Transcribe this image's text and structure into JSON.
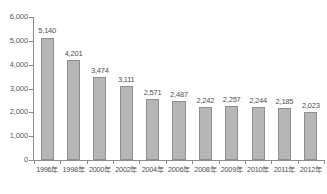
{
  "chart_data": {
    "type": "bar",
    "title": "",
    "subtitle": "",
    "xlabel": "",
    "ylabel": "",
    "ylim": [
      0,
      6000
    ],
    "ytick_values": [
      0,
      1000,
      2000,
      3000,
      4000,
      5000,
      6000
    ],
    "ytick_labels": [
      "0",
      "1,000",
      "2,000",
      "3,000",
      "4,000",
      "5,000",
      "6,000"
    ],
    "grid": false,
    "legend": null,
    "categories": [
      "1996年",
      "1998年",
      "2000年",
      "2002年",
      "2004年",
      "2006年",
      "2008年",
      "2009年",
      "2010年",
      "2011年",
      "2012年"
    ],
    "values": [
      5140,
      4201,
      3474,
      3111,
      2571,
      2487,
      2242,
      2257,
      2244,
      2185,
      2023
    ],
    "value_labels": [
      "5,140",
      "4,201",
      "3,474",
      "3,111",
      "2,571",
      "2,487",
      "2,242",
      "2,257",
      "2,244",
      "2,185",
      "2,023"
    ],
    "bar_color": "#b6b6b6",
    "bar_edge_color": "#8f8f8f",
    "axis_color": "#8c8c8c",
    "text_color": "#4f4f51"
  },
  "caption": ""
}
